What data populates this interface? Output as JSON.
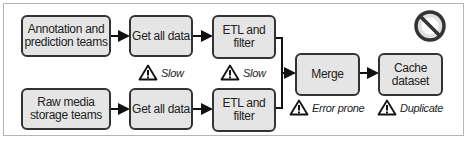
{
  "boxes": {
    "annotation": "Annotation and prediction teams",
    "raw_media": "Raw media storage teams",
    "get_all_1": "Get all data",
    "get_all_2": "Get all data",
    "etl_1": "ETL and filter",
    "etl_2": "ETL and filter",
    "merge": "Merge",
    "cache": "Cache dataset"
  },
  "warnings": {
    "get_all": "Slow",
    "etl": "Slow",
    "merge": "Error prone",
    "cache": "Duplicate"
  },
  "icons": {
    "warning": "warning-triangle-icon",
    "prohibited": "no-entry-icon"
  }
}
